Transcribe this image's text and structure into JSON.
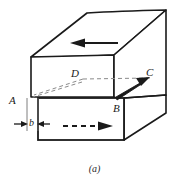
{
  "figure": {
    "caption": "(a)",
    "labels": {
      "vertex_a": "A",
      "vertex_b": "B",
      "vertex_c": "C",
      "vertex_d": "D",
      "shear_offset": "b"
    },
    "colors": {
      "stroke": "#1a1a1a",
      "dashed": "#8a8a8a",
      "face": "#ffffff",
      "background": "#ffffff"
    },
    "annotations": {
      "top_arrow_direction": "left",
      "bottom_arrow_direction": "right",
      "bottom_arrow_style": "dashed",
      "corner_arrow": "B-to-C"
    }
  }
}
